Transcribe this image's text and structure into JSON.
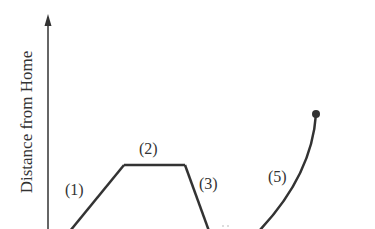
{
  "diagram": {
    "y_axis_label": "Distance from Home",
    "segments": [
      {
        "id": 1,
        "label": "(1)",
        "shape": "rising line"
      },
      {
        "id": 2,
        "label": "(2)",
        "shape": "horizontal line"
      },
      {
        "id": 3,
        "label": "(3)",
        "shape": "falling line"
      },
      {
        "id": 4,
        "label": "(4)",
        "shape": "partially visible"
      },
      {
        "id": 5,
        "label": "(5)",
        "shape": "rising curve ending in dot"
      }
    ],
    "colors": {
      "line": "#333333",
      "background": "#ffffff"
    }
  }
}
